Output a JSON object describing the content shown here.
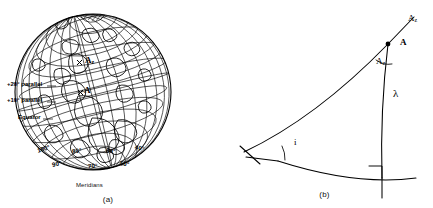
{
  "figure": {
    "panels": [
      {
        "id": "a",
        "caption": "(a)",
        "type": "globe-graticule",
        "axis_caption": "Meridians",
        "parallel_labels": [
          {
            "text": "+20° parallel",
            "x": 7,
            "y": 84
          },
          {
            "text": "+10° parallel",
            "x": 7,
            "y": 100
          },
          {
            "text": "Equator",
            "x": 18,
            "y": 117
          }
        ],
        "meridian_labels": [
          {
            "text": "100°",
            "x": 37,
            "y": 148
          },
          {
            "text": "90°",
            "x": 52,
            "y": 163
          },
          {
            "text": "80°",
            "x": 72,
            "y": 150
          },
          {
            "text": "70°",
            "x": 88,
            "y": 165
          },
          {
            "text": "60°",
            "x": 106,
            "y": 150
          },
          {
            "text": "50°",
            "x": 120,
            "y": 163
          },
          {
            "text": "40°",
            "x": 135,
            "y": 147
          }
        ],
        "point_labels": [
          {
            "text": "A",
            "sub": "z",
            "x": 85,
            "y": 62
          },
          {
            "text": "A",
            "sub": "",
            "x": 84,
            "y": 92
          }
        ]
      },
      {
        "id": "b",
        "caption": "(b)",
        "type": "spherical-triangle",
        "labels": [
          {
            "name": "azimuth-line-label",
            "text": "A",
            "sub": "z",
            "x": 412,
            "y": 21
          },
          {
            "name": "point-a-label",
            "text": "A",
            "sub": "",
            "x": 402,
            "y": 45
          },
          {
            "name": "azimuth-angle-label",
            "text": "A",
            "sub": "z",
            "x": 379,
            "y": 63
          },
          {
            "name": "lambda-label",
            "text": "λ",
            "sub": "",
            "x": 394,
            "y": 95
          },
          {
            "name": "inclination-angle-label",
            "text": "i",
            "sub": "",
            "x": 294,
            "y": 131
          }
        ]
      }
    ]
  },
  "colors": {
    "ink": "#111111",
    "line": "#000000",
    "background": "#ffffff"
  }
}
